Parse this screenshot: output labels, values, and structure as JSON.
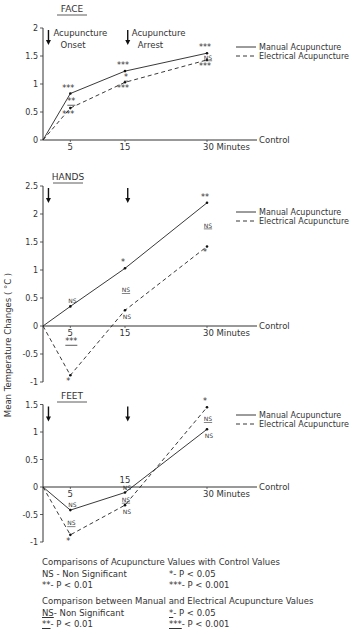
{
  "chart_data": [
    {
      "type": "line",
      "title": "FACE",
      "x": [
        0,
        5,
        15,
        30
      ],
      "xlabel": "Minutes",
      "ylabel": "Mean Temperature Changes ( °C )",
      "ylim": [
        0,
        2
      ],
      "yticks": [
        "0",
        "0.5",
        "1",
        "1.5",
        "2"
      ],
      "xticks": [
        "5",
        "15",
        "30 Minutes"
      ],
      "baseline_label": "Control",
      "arrows": [
        {
          "x": 1,
          "label": "Acupuncture Onset"
        },
        {
          "x": 15.5,
          "label": "Acupuncture Arrest"
        }
      ],
      "series": [
        {
          "name": "Manual Acupuncture",
          "style": "solid",
          "values": [
            0,
            0.83,
            1.23,
            1.55
          ],
          "annotations": [
            "",
            "***",
            "***",
            "***"
          ]
        },
        {
          "name": "Electrical Acupuncture",
          "style": "dashed",
          "values": [
            0,
            0.57,
            1.03,
            1.43
          ],
          "annotations": [
            "",
            "***",
            "***",
            "***"
          ]
        }
      ],
      "between_annotations": [
        "",
        "**",
        "*",
        "NS"
      ],
      "legend_position": "right"
    },
    {
      "type": "line",
      "title": "HANDS",
      "x": [
        0,
        5,
        15,
        30
      ],
      "xlabel": "Minutes",
      "ylabel": "Mean Temperature Changes ( °C )",
      "ylim": [
        -1,
        2.5
      ],
      "yticks": [
        "-1",
        "-0.5",
        "0",
        "0.5",
        "1",
        "1.5",
        "2",
        "2.5"
      ],
      "xticks": [
        "5",
        "15",
        "30 Minutes"
      ],
      "baseline_label": "Control",
      "series": [
        {
          "name": "Manual Acupuncture",
          "style": "solid",
          "values": [
            0,
            0.35,
            1.03,
            2.2
          ],
          "annotations": [
            "",
            "NS",
            "*",
            "**"
          ]
        },
        {
          "name": "Electrical Acupuncture",
          "style": "dashed",
          "values": [
            0,
            -0.88,
            0.28,
            1.42
          ],
          "annotations": [
            "",
            "*",
            "NS",
            "*"
          ]
        }
      ],
      "between_annotations": [
        "",
        "***",
        "NS",
        "NS"
      ],
      "legend_position": "right"
    },
    {
      "type": "line",
      "title": "FEET",
      "x": [
        0,
        5,
        15,
        30
      ],
      "xlabel": "Minutes",
      "ylabel": "Mean Temperature Changes ( °C )",
      "ylim": [
        -1,
        1.5
      ],
      "yticks": [
        "-1",
        "-0.5",
        "0",
        "0.5",
        "1",
        "1.5"
      ],
      "xticks": [
        "5",
        "15",
        "30 Minutes"
      ],
      "baseline_label": "Control",
      "series": [
        {
          "name": "Manual Acupuncture",
          "style": "solid",
          "values": [
            0,
            -0.42,
            -0.1,
            1.05
          ],
          "annotations": [
            "",
            "NS",
            "NS",
            "NS"
          ]
        },
        {
          "name": "Electrical Acupuncture",
          "style": "dashed",
          "values": [
            0,
            -0.87,
            -0.33,
            1.45
          ],
          "annotations": [
            "",
            "*",
            "NS",
            "*"
          ]
        }
      ],
      "between_annotations": [
        "",
        "NS",
        "NS",
        "NS"
      ],
      "legend_position": "right"
    }
  ],
  "labels": {
    "face_title": "FACE",
    "hands_title": "HANDS",
    "feet_title": "FEET",
    "onset_line1": "Acupuncture",
    "onset_line2": "Onset",
    "arrest_line1": "Acupuncture",
    "arrest_line2": "Arrest",
    "ylabel": "Mean Temperature Changes ( °C )",
    "control": "Control",
    "minutes": "30  Minutes",
    "x5": "5",
    "x15": "15",
    "legend_manual": "Manual Acupuncture",
    "legend_electrical": "Electrical Acupuncture"
  },
  "footnotes": {
    "control_heading": "Comparisons of Acupuncture Values with Control Values",
    "control_ns": "NS  - Non Significant",
    "control_p05": "*- P < 0.05",
    "control_p01": "**- P < 0.01",
    "control_p001": "***- P < 0.001",
    "between_heading": "Comparison between Manual and Electrical Acupuncture Values",
    "between_ns_sym": "NS",
    "between_ns": "  - Non Significant",
    "between_p05_sym": "*",
    "between_p05": "- P < 0.05",
    "between_p01_sym": "**",
    "between_p01": "- P < 0.01",
    "between_p001_sym": "***",
    "between_p001": "- P < 0.001"
  }
}
